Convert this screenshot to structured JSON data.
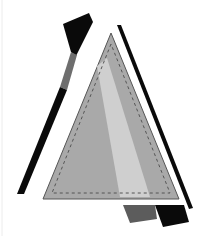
{
  "image": {
    "description": "Abstract geometric composition: dashed-stitch gray triangle flanked by black diagonal stripes and flag shapes",
    "width": 205,
    "height": 236
  },
  "colors": {
    "background": "#ffffff",
    "triangle_fill": "#a9a9a9",
    "triangle_band": "#cfcfcf",
    "triangle_outline": "#555555",
    "stitch": "#555555",
    "black": "#0a0a0a",
    "stripe_gray": "#6e6e6e",
    "bottom_gray": "#5c5c5c",
    "edge_line": "#ececec"
  },
  "shapes": {
    "triangle": {
      "points": "111,33 43,199 179,199"
    },
    "triangle_band": {
      "points": "97,66 107,58 150,197 120,197"
    },
    "stitch_path": {
      "points": "111,44 52,193 170,193"
    },
    "left_flag": {
      "points": "63,24 89,13 93,22 76,56 71,52"
    },
    "left_stripe_gray": {
      "points": "71,52 77,55 67,90 60,87"
    },
    "left_stripe_black": {
      "points": "60,87 67,90 24,194 17,194"
    },
    "right_stripe": {
      "points": "117,25 121,25 193,208 189,209"
    },
    "bottom_gray": {
      "points": "123,205 155,205 157,219 130,223"
    },
    "bottom_black": {
      "points": "155,205 184,205 189,222 163,227"
    }
  }
}
